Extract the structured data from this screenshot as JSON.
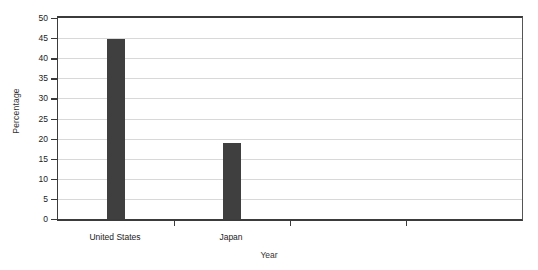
{
  "chart_data": {
    "type": "bar",
    "title": "",
    "xlabel": "Year",
    "ylabel": "Percentage",
    "categories": [
      "United States",
      "Japan",
      "",
      ""
    ],
    "values": [
      44.7,
      19.0,
      null,
      null
    ],
    "ylim": [
      0,
      50
    ],
    "ytick_values": [
      0,
      5,
      10,
      15,
      20,
      25,
      30,
      35,
      40,
      45,
      50
    ],
    "ytick_labels": [
      "0",
      "5",
      "10",
      "15",
      "20",
      "25",
      "30",
      "35",
      "40",
      "45",
      "50"
    ],
    "grid": "horizontal",
    "legend": "none",
    "bar_color": "#3f3f3f",
    "gridline_color": "#d8d8d8",
    "axis_color": "#3b3b3b",
    "background_color": "#ffffff"
  }
}
